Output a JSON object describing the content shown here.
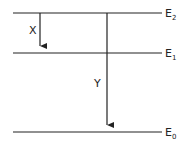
{
  "diagram": {
    "type": "energy-level-diagram",
    "levels": [
      {
        "name": "E2",
        "base": "E",
        "sub": "2",
        "y": 13
      },
      {
        "name": "E1",
        "base": "E",
        "sub": "1",
        "y": 53
      },
      {
        "name": "E0",
        "base": "E",
        "sub": "0",
        "y": 132
      }
    ],
    "transitions": [
      {
        "label": "X",
        "from": "E2",
        "to": "E1",
        "x": 40
      },
      {
        "label": "Y",
        "from": "E2",
        "to": "E0",
        "x": 107
      }
    ],
    "colors": {
      "line": "#222222",
      "background": "#ffffff"
    }
  }
}
